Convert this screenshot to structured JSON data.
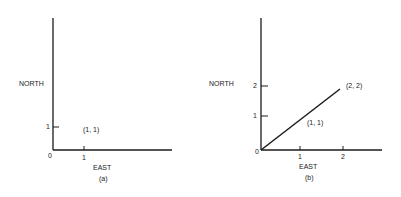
{
  "panels": [
    {
      "id": "a",
      "caption": "(a)",
      "x_axis_label": "EAST",
      "y_axis_label": "NORTH",
      "origin_label": "0",
      "x_ticks": [
        "1"
      ],
      "y_ticks": [
        "1"
      ],
      "point_label": "(1, 1)"
    },
    {
      "id": "b",
      "caption": "(b)",
      "x_axis_label": "EAST",
      "y_axis_label": "NORTH",
      "origin_label": "0",
      "x_ticks": [
        "1",
        "2"
      ],
      "y_ticks": [
        "1",
        "2"
      ],
      "point_labels": [
        "(1, 1)",
        "(2, 2)"
      ]
    }
  ],
  "colors": {
    "ink": "#1a1a1a",
    "background": "#ffffff"
  }
}
